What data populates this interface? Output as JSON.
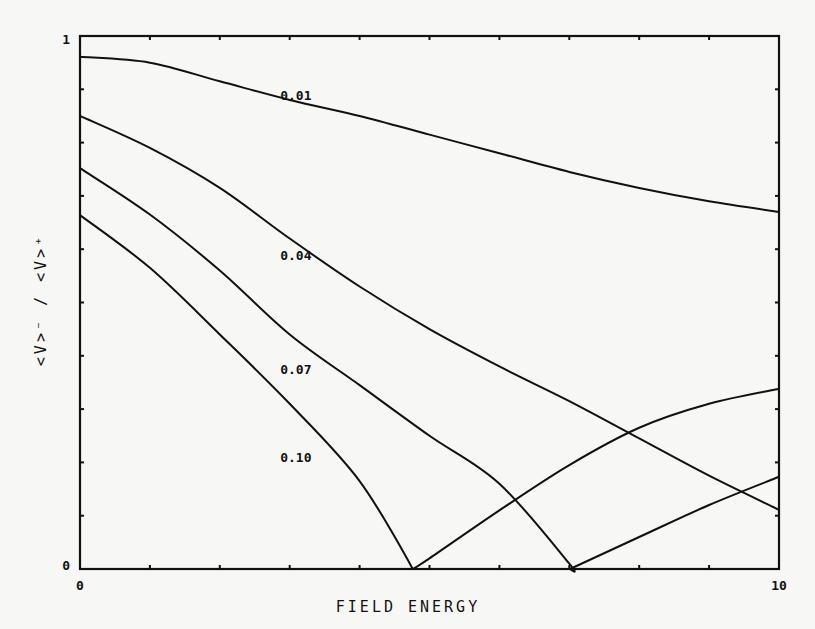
{
  "chart_data": {
    "type": "line",
    "title": "",
    "xlabel": "FIELD ENERGY",
    "ylabel": "<V>⁻ / <V>⁺",
    "xlim": [
      0,
      10
    ],
    "ylim": [
      0,
      1
    ],
    "x_tick_labels": {
      "min": "0",
      "max": "10"
    },
    "y_tick_labels": {
      "min": "0",
      "max": "1"
    },
    "x_minor_divisions": 10,
    "y_minor_divisions": 10,
    "grid": false,
    "legend": "inline curve labels",
    "series": [
      {
        "name": "0.01",
        "label_pos": [
          3.15,
          0.89
        ],
        "points": [
          [
            0,
            0.961
          ],
          [
            1,
            0.95
          ],
          [
            2,
            0.915
          ],
          [
            3,
            0.88
          ],
          [
            4,
            0.85
          ],
          [
            5,
            0.815
          ],
          [
            6,
            0.78
          ],
          [
            7,
            0.745
          ],
          [
            8,
            0.715
          ],
          [
            9,
            0.69
          ],
          [
            10,
            0.67
          ]
        ]
      },
      {
        "name": "0.04",
        "label_pos": [
          3.15,
          0.59
        ],
        "points": [
          [
            0,
            0.85
          ],
          [
            1,
            0.79
          ],
          [
            2,
            0.715
          ],
          [
            3,
            0.62
          ],
          [
            4,
            0.53
          ],
          [
            5,
            0.45
          ],
          [
            6,
            0.38
          ],
          [
            7,
            0.315
          ],
          [
            8,
            0.245
          ],
          [
            9,
            0.175
          ],
          [
            10,
            0.111
          ]
        ]
      },
      {
        "name": "0.07",
        "label_pos": [
          3.15,
          0.375
        ],
        "points": [
          [
            0,
            0.752
          ],
          [
            1,
            0.665
          ],
          [
            2,
            0.56
          ],
          [
            3,
            0.44
          ],
          [
            4,
            0.345
          ],
          [
            5,
            0.25
          ],
          [
            6,
            0.16
          ],
          [
            7,
            0.01
          ],
          [
            7.01,
            0.0
          ],
          [
            8,
            0.06
          ],
          [
            9,
            0.12
          ],
          [
            10,
            0.173
          ]
        ]
      },
      {
        "name": "0.10",
        "label_pos": [
          3.15,
          0.21
        ],
        "points": [
          [
            0,
            0.664
          ],
          [
            1,
            0.565
          ],
          [
            2,
            0.44
          ],
          [
            3,
            0.31
          ],
          [
            4,
            0.165
          ],
          [
            4.76,
            0.0
          ],
          [
            5,
            0.02
          ],
          [
            6,
            0.11
          ],
          [
            7,
            0.195
          ],
          [
            8,
            0.265
          ],
          [
            9,
            0.31
          ],
          [
            10,
            0.338
          ]
        ]
      }
    ]
  }
}
